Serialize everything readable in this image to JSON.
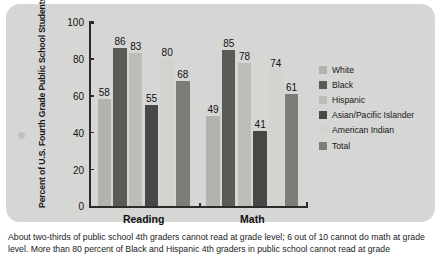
{
  "chart_data": {
    "type": "bar",
    "title": "",
    "xlabel": "",
    "ylabel": "Percent of U.S. Fourth Grade Public School Students Performing Below Grade Level: 2007",
    "ylim": [
      0,
      100
    ],
    "yticks": [
      0,
      20,
      40,
      60,
      80,
      100
    ],
    "grid": false,
    "legend_position": "right",
    "categories": [
      "Reading",
      "Math"
    ],
    "series": [
      {
        "name": "White",
        "color": "#b2b2ae",
        "values": [
          58,
          49
        ]
      },
      {
        "name": "Black",
        "color": "#5a5a57",
        "values": [
          86,
          85
        ]
      },
      {
        "name": "Hispanic",
        "color": "#bcbcb8",
        "values": [
          83,
          78
        ]
      },
      {
        "name": "Asian/Pacific Islander",
        "color": "#474745",
        "values": [
          55,
          41
        ]
      },
      {
        "name": "American Indian",
        "color": "#d2d2ce",
        "values": [
          80,
          74
        ]
      },
      {
        "name": "Total",
        "color": "#7c7c78",
        "values": [
          68,
          61
        ]
      }
    ]
  },
  "caption": {
    "line1": "About two-thirds of public school 4th graders cannot read at grade level; 6 out of 10 cannot do math at",
    "line2": "grade level. More than 80 percent of Black and Hispanic 4th graders in public school cannot read at grade"
  }
}
